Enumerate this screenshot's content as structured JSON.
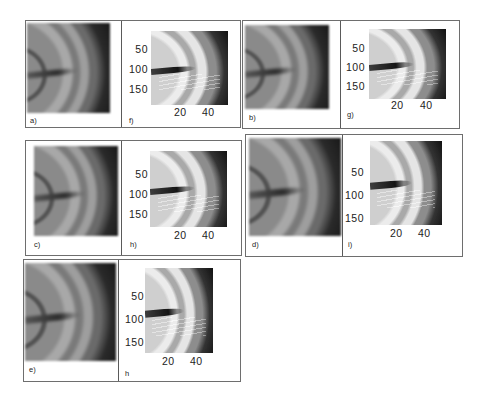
{
  "figure": {
    "panels": [
      {
        "id": "a",
        "label": "a)",
        "type": "original"
      },
      {
        "id": "f",
        "label": "f)",
        "type": "enhanced"
      },
      {
        "id": "b",
        "label": "b)",
        "type": "original"
      },
      {
        "id": "g",
        "label": "g)",
        "type": "enhanced"
      },
      {
        "id": "c",
        "label": "c)",
        "type": "original"
      },
      {
        "id": "h1",
        "label": "h)",
        "type": "enhanced"
      },
      {
        "id": "d",
        "label": "d)",
        "type": "original"
      },
      {
        "id": "i",
        "label": "i)",
        "type": "enhanced"
      },
      {
        "id": "e",
        "label": "e)",
        "type": "original"
      },
      {
        "id": "h2",
        "label": "h",
        "type": "enhanced"
      }
    ],
    "axes": {
      "yticks": [
        "50",
        "100",
        "150"
      ],
      "xticks": [
        "20",
        "40"
      ]
    }
  }
}
